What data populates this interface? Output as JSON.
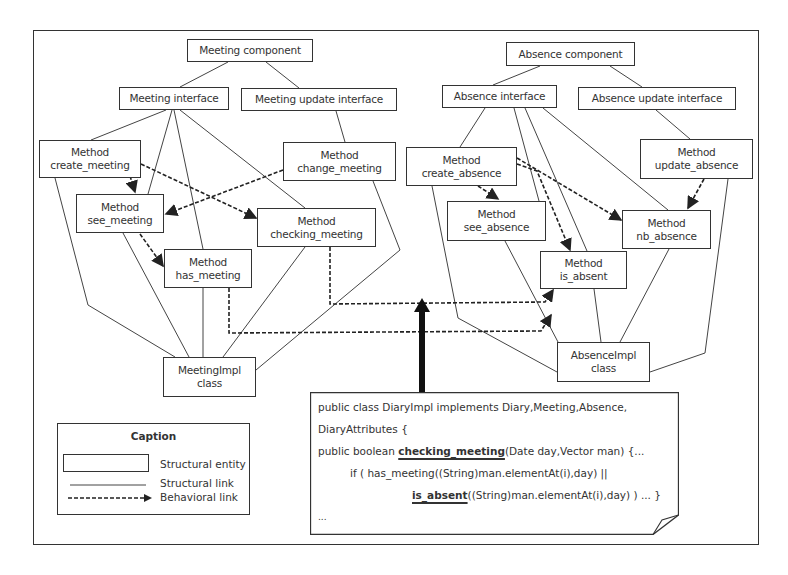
{
  "diagram": {
    "meeting": {
      "component": "Meeting component",
      "interface": "Meeting interface",
      "update_interface": "Meeting update interface",
      "methods": {
        "create": [
          "Method",
          "create_meeting"
        ],
        "change": [
          "Method",
          "change_meeting"
        ],
        "see": [
          "Method",
          "see_meeting"
        ],
        "checking": [
          "Method",
          "checking_meeting"
        ],
        "has": [
          "Method",
          "has_meeting"
        ]
      },
      "impl": [
        "MeetingImpl",
        "class"
      ]
    },
    "absence": {
      "component": "Absence component",
      "interface": "Absence interface",
      "update_interface": "Absence update interface",
      "methods": {
        "create": [
          "Method",
          "create_absence"
        ],
        "update": [
          "Method",
          "update_absence"
        ],
        "see": [
          "Method",
          "see_absence"
        ],
        "nb": [
          "Method",
          "nb_absence"
        ],
        "is_absent": [
          "Method",
          "is_absent"
        ]
      },
      "impl": [
        "AbsenceImpl",
        "class"
      ]
    },
    "caption": {
      "title": "Caption",
      "entity": "Structural entity",
      "structural_link": "Structural link",
      "behavioral_link": "Behavioral link"
    },
    "code": {
      "l1": "public class DiaryImpl implements Diary,Meeting,Absence,",
      "l2": "DiaryAttributes {",
      "l3_pre": "public boolean ",
      "l3_bold": "checking_meeting",
      "l3_post": "(Date day,Vector man)   {...",
      "l4": "if ( has_meeting((String)man.elementAt(i),day) ||",
      "l5_bold": "is_absent",
      "l5_post": "((String)man.elementAt(i),day) )   ... }",
      "l6": "..."
    }
  }
}
